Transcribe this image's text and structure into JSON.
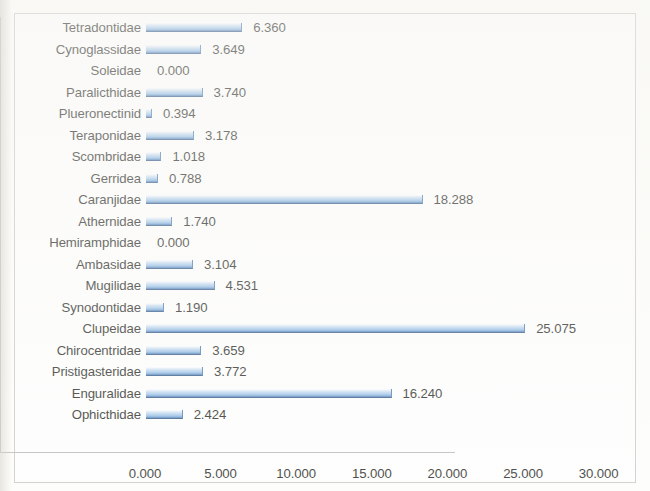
{
  "chart_data": {
    "type": "bar",
    "orientation": "horizontal",
    "title": "",
    "xlabel": "",
    "ylabel": "",
    "xlim": [
      0,
      30
    ],
    "xticks": [
      "0.000",
      "5.000",
      "10.000",
      "15.000",
      "20.000",
      "25.000",
      "30.000"
    ],
    "xtick_values": [
      0,
      5,
      10,
      15,
      20,
      25,
      30
    ],
    "grid": false,
    "legend": false,
    "bar_color": "#9cc3e8",
    "bar_edge_color": "#2d5485",
    "categories": [
      "Tetradontidae",
      "Cynoglassidae",
      "Soleidae",
      "Paralicthidae",
      "Plueronectinid",
      "Teraponidae",
      "Scombridae",
      "Gerridea",
      "Caranjidae",
      "Athernidae",
      "Hemiramphidae",
      "Ambasidae",
      "Mugilidae",
      "Synodontidae",
      "Clupeidae",
      "Chirocentridae",
      "Pristigasteridae",
      "Enguralidae",
      "Ophicthidae"
    ],
    "values": [
      6.36,
      3.649,
      0.0,
      3.74,
      0.394,
      3.178,
      1.018,
      0.788,
      18.288,
      1.74,
      0.0,
      3.104,
      4.531,
      1.19,
      25.075,
      3.659,
      3.772,
      16.24,
      2.424
    ],
    "value_labels": [
      "6.360",
      "3.649",
      "0.000",
      "3.740",
      "0.394",
      "3.178",
      "1.018",
      "0.788",
      "18.288",
      "1.740",
      "0.000",
      "3.104",
      "4.531",
      "1.190",
      "25.075",
      "3.659",
      "3.772",
      "16.240",
      "2.424"
    ]
  }
}
